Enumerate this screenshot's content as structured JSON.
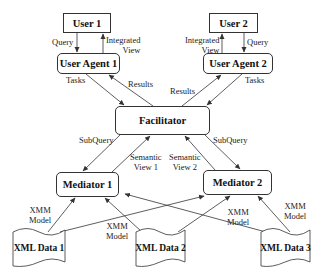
{
  "nodes": {
    "user1": "User 1",
    "user2": "User 2",
    "user_agent1": "User Agent 1",
    "user_agent2": "User Agent 2",
    "facilitator": "Facilitator",
    "mediator1": "Mediator 1",
    "mediator2": "Mediator 2",
    "xml_data1": "XML Data 1",
    "xml_data2": "XML Data 2",
    "xml_data3": "XML Data 3"
  },
  "edge_labels": {
    "query1": "Query",
    "integrated_view1_l1": "Integrated",
    "integrated_view1_l2": "View",
    "query2": "Query",
    "integrated_view2_l1": "Integrated",
    "integrated_view2_l2": "View",
    "tasks1": "Tasks",
    "results1": "Results",
    "results2": "Results",
    "tasks2": "Tasks",
    "subquery1": "SubQuery",
    "subquery2": "SubQuery",
    "semantic_view1_l1": "Semantic",
    "semantic_view1_l2": "View 1",
    "semantic_view2_l1": "Semantic",
    "semantic_view2_l2": "View 2",
    "xmm1_l1": "XMM",
    "xmm1_l2": "Model",
    "xmm2_l1": "XMM",
    "xmm2_l2": "Model",
    "xmm3_l1": "XMM",
    "xmm3_l2": "Model",
    "xmm4_l1": "XMM",
    "xmm4_l2": "Model"
  },
  "colors": {
    "line": "#333333",
    "background": "#ffffff"
  }
}
